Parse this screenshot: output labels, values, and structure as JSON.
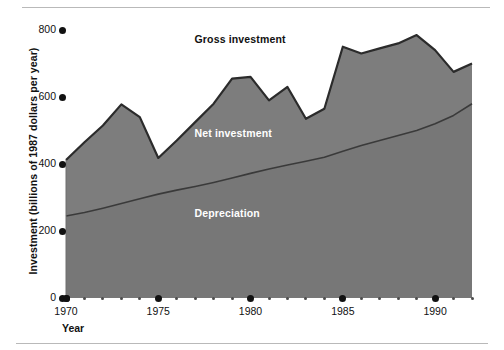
{
  "chart_data": {
    "type": "area",
    "title": "",
    "xlabel": "Year",
    "ylabel": "Investment (billions of 1987 dollars per year)",
    "xlim": [
      1970,
      1992
    ],
    "ylim": [
      0,
      800
    ],
    "yticks": [
      0,
      200,
      400,
      600,
      800
    ],
    "ytick_labels": [
      "0",
      "200",
      "400",
      "600",
      "800"
    ],
    "xticks_major": [
      1970,
      1975,
      1980,
      1985,
      1990
    ],
    "xtick_labels": [
      "1970",
      "1975",
      "1980",
      "1985",
      "1990"
    ],
    "xticks_minor": [
      1971,
      1972,
      1973,
      1974,
      1976,
      1977,
      1978,
      1979,
      1981,
      1982,
      1983,
      1984,
      1986,
      1987,
      1988,
      1989,
      1991,
      1992
    ],
    "grid": false,
    "legend_position": "inline-annotations",
    "x": [
      1970,
      1971,
      1972,
      1973,
      1974,
      1975,
      1976,
      1977,
      1978,
      1979,
      1980,
      1981,
      1982,
      1983,
      1984,
      1985,
      1986,
      1987,
      1988,
      1989,
      1990,
      1991,
      1992
    ],
    "series": [
      {
        "name": "Gross investment",
        "label_color": "#111111",
        "values": [
          412,
          465,
          515,
          578,
          540,
          418,
          470,
          525,
          580,
          655,
          660,
          590,
          630,
          535,
          565,
          750,
          730,
          745,
          760,
          785,
          740,
          675,
          700
        ]
      },
      {
        "name": "Depreciation",
        "label_color": "#ffffff",
        "values": [
          245,
          255,
          268,
          282,
          296,
          310,
          322,
          333,
          345,
          358,
          372,
          385,
          397,
          408,
          420,
          438,
          455,
          470,
          485,
          500,
          520,
          545,
          580
        ]
      }
    ],
    "annotations": [
      {
        "name": "Gross investment",
        "x": 1980,
        "y": 770,
        "color": "#111111"
      },
      {
        "name": "Net investment",
        "x": 1980,
        "y": 490,
        "color": "#ffffff"
      },
      {
        "name": "Depreciation",
        "x": 1980,
        "y": 250,
        "color": "#ffffff"
      }
    ],
    "colors": {
      "net_band": "#7d7d7d",
      "depreciation_band": "#777777",
      "gross_line": "#2b2b2b",
      "depreciation_line": "#3a3a3a",
      "axis_text": "#111111",
      "background": "#ffffff"
    }
  },
  "figure": {
    "axis_title_y": "Investment (billions of 1987 dollars per year)",
    "axis_title_x": "Year"
  }
}
